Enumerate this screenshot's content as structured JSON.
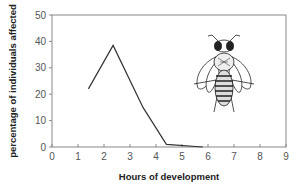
{
  "chart_data": {
    "type": "line",
    "title": "",
    "xlabel": "Hours of development",
    "ylabel": "percentage of individuals affected",
    "xlim": [
      0,
      9
    ],
    "ylim": [
      0,
      50
    ],
    "x_ticks": [
      0,
      1,
      2,
      3,
      4,
      5,
      6,
      7,
      8,
      9
    ],
    "y_ticks": [
      0,
      10,
      20,
      30,
      40,
      50
    ],
    "grid": false,
    "legend": null,
    "series": [
      {
        "name": "affected",
        "color": "#333333",
        "x": [
          1.4,
          2.35,
          3.5,
          4.4,
          5.8
        ],
        "y": [
          22,
          38.5,
          15,
          1,
          0
        ]
      }
    ],
    "annotations": [
      {
        "type": "illustration",
        "subject": "bee-icon",
        "position": "upper-right inside plot"
      }
    ]
  }
}
